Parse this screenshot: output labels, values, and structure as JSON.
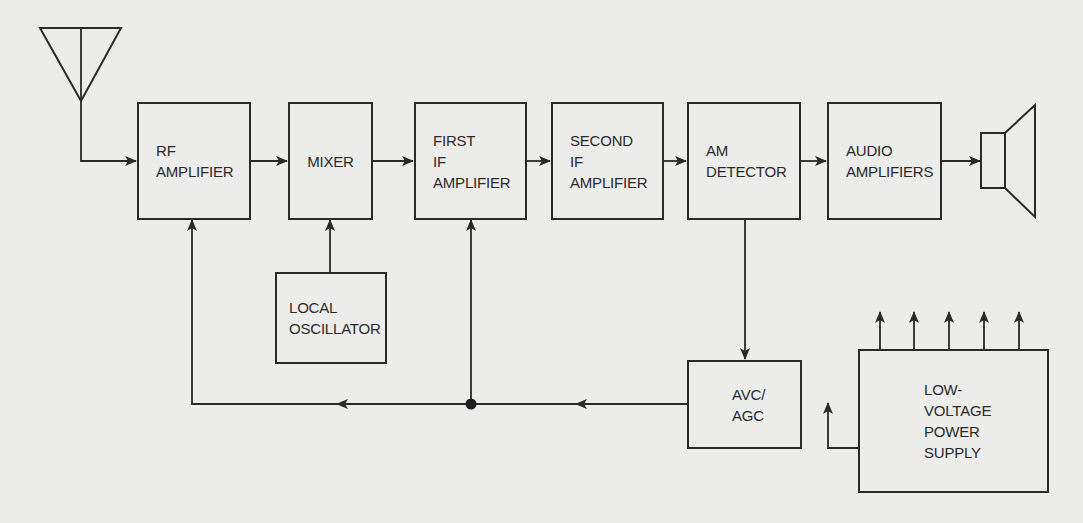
{
  "diagram": {
    "colors": {
      "background": "#ececeb",
      "stroke": "#2a2a2a"
    },
    "blocks": {
      "rf_amplifier": {
        "lines": [
          "RF",
          "AMPLIFIER"
        ]
      },
      "mixer": {
        "lines": [
          "MIXER"
        ]
      },
      "first_if_amplifier": {
        "lines": [
          "FIRST",
          "IF",
          "AMPLIFIER"
        ]
      },
      "second_if_amplifier": {
        "lines": [
          "SECOND",
          "IF",
          "AMPLIFIER"
        ]
      },
      "am_detector": {
        "lines": [
          "AM",
          "DETECTOR"
        ]
      },
      "audio_amplifiers": {
        "lines": [
          "AUDIO",
          "AMPLIFIERS"
        ]
      },
      "local_oscillator": {
        "lines": [
          "LOCAL",
          "OSCILLATOR"
        ]
      },
      "avc_agc": {
        "lines": [
          "AVC/",
          "AGC"
        ]
      },
      "low_voltage_power_supply": {
        "lines": [
          "LOW-",
          "VOLTAGE",
          "POWER",
          "SUPPLY"
        ]
      }
    },
    "icons": {
      "antenna": "antenna-icon",
      "speaker": "speaker-icon",
      "junction": "junction-dot-icon"
    },
    "connections": [
      {
        "from": "antenna",
        "to": "rf_amplifier"
      },
      {
        "from": "rf_amplifier",
        "to": "mixer"
      },
      {
        "from": "local_oscillator",
        "to": "mixer"
      },
      {
        "from": "mixer",
        "to": "first_if_amplifier"
      },
      {
        "from": "first_if_amplifier",
        "to": "second_if_amplifier"
      },
      {
        "from": "second_if_amplifier",
        "to": "am_detector"
      },
      {
        "from": "am_detector",
        "to": "audio_amplifiers"
      },
      {
        "from": "audio_amplifiers",
        "to": "speaker"
      },
      {
        "from": "am_detector",
        "to": "avc_agc"
      },
      {
        "from": "avc_agc",
        "to": "first_if_amplifier"
      },
      {
        "from": "avc_agc",
        "to": "rf_amplifier"
      },
      {
        "from": "low_voltage_power_supply",
        "to": "outputs",
        "count": 5
      }
    ]
  }
}
